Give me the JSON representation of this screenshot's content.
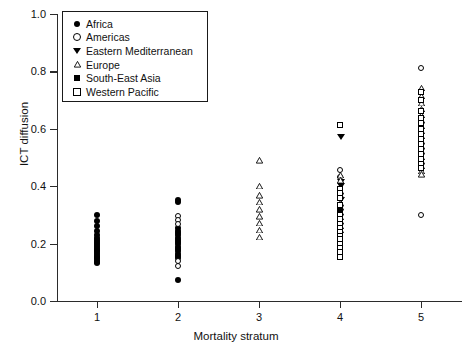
{
  "chart_data": {
    "type": "scatter",
    "title": "",
    "xlabel": "Mortality stratum",
    "ylabel": "ICT diffusion",
    "xlim": [
      0.45,
      5.55
    ],
    "ylim": [
      0.0,
      1.0
    ],
    "xticks": [
      "1",
      "2",
      "3",
      "4",
      "5"
    ],
    "yticks": [
      "0.0",
      "0.2",
      "0.4",
      "0.6",
      "0.8",
      "1.0"
    ],
    "grid": false,
    "legend_position": "upper-left-inside",
    "legend": [
      {
        "label": "Africa",
        "marker": "filled-circle"
      },
      {
        "label": "Americas",
        "marker": "open-circle"
      },
      {
        "label": "Eastern Mediterranean",
        "marker": "filled-triangle-down"
      },
      {
        "label": "Europe",
        "marker": "open-triangle-up"
      },
      {
        "label": "South-East Asia",
        "marker": "filled-square"
      },
      {
        "label": "Western Pacific",
        "marker": "open-square"
      }
    ],
    "series": [
      {
        "name": "Africa",
        "marker": "filled-circle",
        "points": [
          [
            1,
            0.3
          ],
          [
            1,
            0.278
          ],
          [
            1,
            0.262
          ],
          [
            1,
            0.243
          ],
          [
            1,
            0.228
          ],
          [
            1,
            0.218
          ],
          [
            1,
            0.211
          ],
          [
            1,
            0.204
          ],
          [
            1,
            0.197
          ],
          [
            1,
            0.19
          ],
          [
            1,
            0.184
          ],
          [
            1,
            0.178
          ],
          [
            1,
            0.172
          ],
          [
            1,
            0.166
          ],
          [
            1,
            0.16
          ],
          [
            1,
            0.154
          ],
          [
            1,
            0.148
          ],
          [
            1,
            0.142
          ],
          [
            1,
            0.136
          ],
          [
            1,
            0.131
          ],
          [
            2,
            0.352
          ],
          [
            2,
            0.344
          ],
          [
            2,
            0.252
          ],
          [
            2,
            0.244
          ],
          [
            2,
            0.236
          ],
          [
            2,
            0.228
          ],
          [
            2,
            0.22
          ],
          [
            2,
            0.212
          ],
          [
            2,
            0.204
          ],
          [
            2,
            0.196
          ],
          [
            2,
            0.188
          ],
          [
            2,
            0.18
          ],
          [
            2,
            0.172
          ],
          [
            2,
            0.164
          ],
          [
            2,
            0.156
          ],
          [
            2,
            0.148
          ],
          [
            2,
            0.072
          ]
        ]
      },
      {
        "name": "Americas",
        "marker": "open-circle",
        "points": [
          [
            2,
            0.296
          ],
          [
            2,
            0.282
          ],
          [
            2,
            0.268
          ],
          [
            2,
            0.14
          ],
          [
            2,
            0.122
          ],
          [
            4,
            0.455
          ],
          [
            4,
            0.43
          ],
          [
            5,
            0.81
          ],
          [
            5,
            0.3
          ]
        ]
      },
      {
        "name": "Eastern Mediterranean",
        "marker": "filled-triangle-down",
        "points": [
          [
            4,
            0.572
          ],
          [
            4,
            0.412
          ],
          [
            4,
            0.398
          ],
          [
            4,
            0.352
          ]
        ]
      },
      {
        "name": "Europe",
        "marker": "open-triangle-up",
        "points": [
          [
            3,
            0.49
          ],
          [
            3,
            0.4
          ],
          [
            3,
            0.368
          ],
          [
            3,
            0.345
          ],
          [
            3,
            0.318
          ],
          [
            3,
            0.295
          ],
          [
            3,
            0.272
          ],
          [
            3,
            0.248
          ],
          [
            3,
            0.222
          ],
          [
            4,
            0.438
          ],
          [
            4,
            0.42
          ],
          [
            4,
            0.382
          ],
          [
            4,
            0.368
          ],
          [
            4,
            0.34
          ],
          [
            4,
            0.325
          ],
          [
            4,
            0.308
          ],
          [
            4,
            0.292
          ],
          [
            4,
            0.276
          ],
          [
            4,
            0.262
          ],
          [
            4,
            0.248
          ],
          [
            5,
            0.742
          ],
          [
            5,
            0.714
          ],
          [
            5,
            0.69
          ],
          [
            5,
            0.668
          ],
          [
            5,
            0.648
          ],
          [
            5,
            0.628
          ],
          [
            5,
            0.61
          ],
          [
            5,
            0.592
          ],
          [
            5,
            0.574
          ],
          [
            5,
            0.556
          ],
          [
            5,
            0.538
          ],
          [
            5,
            0.52
          ],
          [
            5,
            0.502
          ],
          [
            5,
            0.486
          ],
          [
            5,
            0.47
          ],
          [
            5,
            0.452
          ],
          [
            5,
            0.44
          ]
        ]
      },
      {
        "name": "South-East Asia",
        "marker": "filled-square",
        "points": [
          [
            4,
            0.366
          ],
          [
            4,
            0.318
          ],
          [
            4,
            0.232
          ],
          [
            4,
            0.205
          ],
          [
            4,
            0.19
          ],
          [
            4,
            0.175
          ]
        ]
      },
      {
        "name": "Western Pacific",
        "marker": "open-square",
        "points": [
          [
            4,
            0.612
          ],
          [
            4,
            0.39
          ],
          [
            4,
            0.374
          ],
          [
            4,
            0.358
          ],
          [
            4,
            0.332
          ],
          [
            4,
            0.3
          ],
          [
            4,
            0.284
          ],
          [
            4,
            0.268
          ],
          [
            4,
            0.255
          ],
          [
            4,
            0.24
          ],
          [
            4,
            0.226
          ],
          [
            4,
            0.214
          ],
          [
            4,
            0.198
          ],
          [
            4,
            0.182
          ],
          [
            4,
            0.168
          ],
          [
            4,
            0.152
          ],
          [
            5,
            0.726
          ],
          [
            5,
            0.7
          ],
          [
            5,
            0.66
          ],
          [
            5,
            0.638
          ],
          [
            5,
            0.618
          ],
          [
            5,
            0.6
          ],
          [
            5,
            0.582
          ],
          [
            5,
            0.564
          ],
          [
            5,
            0.546
          ],
          [
            5,
            0.528
          ],
          [
            5,
            0.51
          ],
          [
            5,
            0.492
          ],
          [
            5,
            0.476
          ],
          [
            5,
            0.462
          ]
        ]
      }
    ]
  }
}
